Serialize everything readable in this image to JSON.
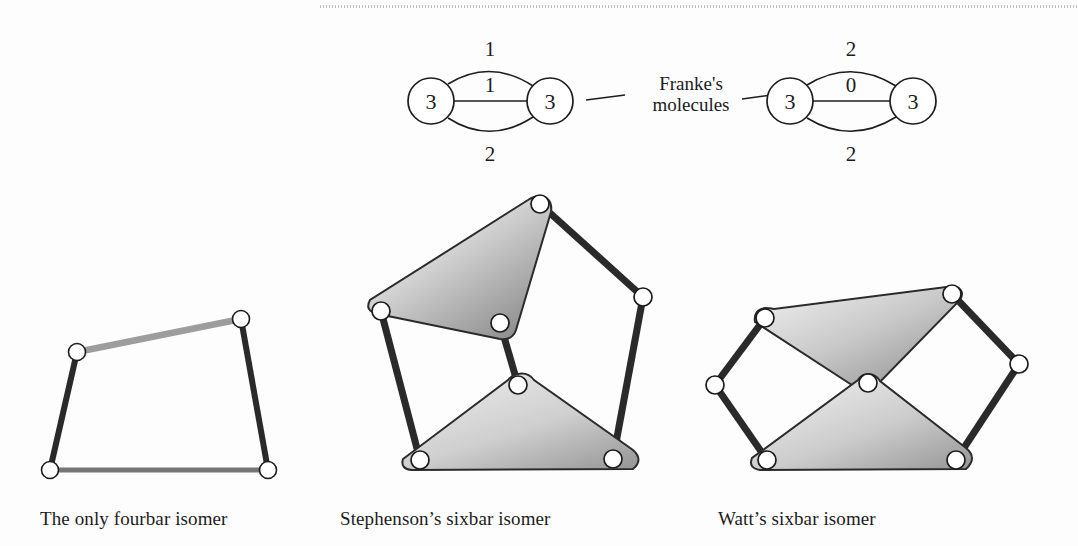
{
  "figure": {
    "molecules": {
      "connector_label": "Franke's\nmolecules",
      "connector_label_line1": "Franke's",
      "connector_label_line2": "molecules",
      "left": {
        "name": "franke-molecule-left",
        "node_left_value": "3",
        "node_right_value": "3",
        "edge_top_label": "1",
        "edge_middle_label": "1",
        "edge_bottom_label": "2"
      },
      "right": {
        "name": "franke-molecule-right",
        "node_left_value": "3",
        "node_right_value": "3",
        "edge_top_label": "2",
        "edge_middle_label": "0",
        "edge_bottom_label": "2"
      }
    },
    "linkages": [
      {
        "id": "fourbar",
        "caption": "The only fourbar isomer",
        "joint_count": 4,
        "link_count": 4
      },
      {
        "id": "stephenson-sixbar",
        "caption": "Stephenson’s sixbar isomer",
        "joint_count": 7,
        "link_count": 6
      },
      {
        "id": "watt-sixbar",
        "caption": "Watt’s sixbar isomer",
        "joint_count": 7,
        "link_count": 6
      }
    ],
    "colors": {
      "ink": "#1c1c1c",
      "link_dark": "#2a2a2a",
      "link_mid_gray": "#767676",
      "link_light_gray": "#9d9d9d",
      "ternary_fill_light": "#f2f2f2",
      "ternary_fill_dark": "#7b7b7b",
      "joint_fill": "#ffffff",
      "page_background": "#fdfdfd"
    }
  }
}
